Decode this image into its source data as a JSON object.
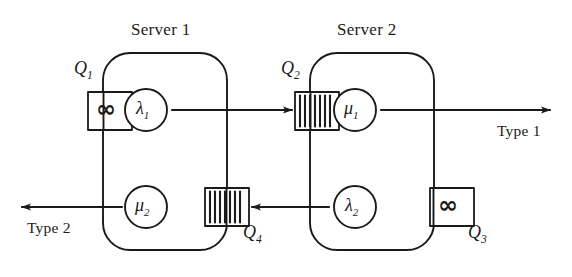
{
  "diagram": {
    "type": "queueing-network",
    "background_color": "#ffffff",
    "ink_color": "#1c1a18"
  },
  "servers": [
    {
      "id": "server-1",
      "label": "Server 1",
      "label_x": 131,
      "label_y": 20,
      "box": {
        "x": 103,
        "y": 53,
        "width": 124,
        "height": 197,
        "radius": 26
      },
      "stations": [
        {
          "id": "station-lambda1",
          "symbol": "λ",
          "subscript": "1",
          "cx": 146,
          "cy": 110,
          "r": 21
        },
        {
          "id": "station-mu2",
          "symbol": "μ",
          "subscript": "2",
          "cx": 146,
          "cy": 207,
          "r": 21
        }
      ]
    },
    {
      "id": "server-2",
      "label": "Server 2",
      "label_x": 337,
      "label_y": 20,
      "box": {
        "x": 310,
        "y": 53,
        "width": 124,
        "height": 197,
        "radius": 26
      },
      "stations": [
        {
          "id": "station-mu1",
          "symbol": "μ",
          "subscript": "1",
          "cx": 355,
          "cy": 110,
          "r": 21
        },
        {
          "id": "station-lambda2",
          "symbol": "λ",
          "subscript": "2",
          "cx": 355,
          "cy": 207,
          "r": 21
        }
      ]
    }
  ],
  "queues": [
    {
      "id": "queue-q1",
      "label": "Q",
      "subscript": "1",
      "buffer_type": "infinite",
      "glyph": "∞",
      "box": {
        "x": 88,
        "y": 92,
        "width": 44,
        "height": 38
      },
      "label_x": 74,
      "label_y": 64
    },
    {
      "id": "queue-q2",
      "label": "Q",
      "subscript": "2",
      "buffer_type": "finite",
      "glyph": "stripes",
      "stripe_count": 7,
      "box": {
        "x": 295,
        "y": 92,
        "width": 44,
        "height": 38
      },
      "label_x": 281,
      "label_y": 64
    },
    {
      "id": "queue-q3",
      "label": "Q",
      "subscript": "3",
      "buffer_type": "infinite",
      "glyph": "∞",
      "box": {
        "x": 430,
        "y": 188,
        "width": 44,
        "height": 38
      },
      "label_x": 468,
      "label_y": 228
    },
    {
      "id": "queue-q4",
      "label": "Q",
      "subscript": "4",
      "buffer_type": "finite",
      "glyph": "stripes",
      "stripe_count": 7,
      "box": {
        "x": 205,
        "y": 188,
        "width": 44,
        "height": 38
      },
      "label_x": 243,
      "label_y": 228
    }
  ],
  "flows": [
    {
      "id": "flow-lambda1-to-q2",
      "from": "station-lambda1",
      "to": "queue-q2",
      "direction": "right"
    },
    {
      "id": "flow-mu1-to-type1",
      "from": "station-mu1",
      "to": "exit-type-1",
      "direction": "right"
    },
    {
      "id": "flow-lambda2-to-q4",
      "from": "station-lambda2",
      "to": "queue-q4",
      "direction": "left"
    },
    {
      "id": "flow-mu2-to-type2",
      "from": "station-mu2",
      "to": "exit-type-2",
      "direction": "left"
    }
  ],
  "exits": [
    {
      "id": "exit-type-1",
      "label": "Type 1",
      "label_x": 497,
      "label_y": 122
    },
    {
      "id": "exit-type-2",
      "label": "Type 2",
      "label_x": 27,
      "label_y": 219
    }
  ]
}
